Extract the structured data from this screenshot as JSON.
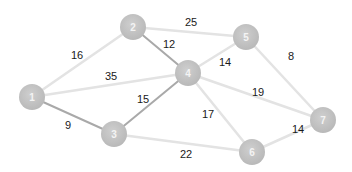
{
  "graph": {
    "type": "weighted-undirected-graph",
    "colors": {
      "background": "#ffffff",
      "node_fill": "#bdbdbd",
      "node_label": "#f4f4f4",
      "edge_default": "#e3e3e3",
      "edge_highlight": "#a9a9a9",
      "weight_text": "#1a1a1a"
    },
    "nodes": [
      {
        "id": "1",
        "label": "1",
        "x": 32,
        "y": 97
      },
      {
        "id": "2",
        "label": "2",
        "x": 133,
        "y": 27
      },
      {
        "id": "3",
        "label": "3",
        "x": 114,
        "y": 134
      },
      {
        "id": "4",
        "label": "4",
        "x": 188,
        "y": 73
      },
      {
        "id": "5",
        "label": "5",
        "x": 246,
        "y": 37
      },
      {
        "id": "6",
        "label": "6",
        "x": 252,
        "y": 152
      },
      {
        "id": "7",
        "label": "7",
        "x": 323,
        "y": 120
      }
    ],
    "edges": [
      {
        "from": "1",
        "to": "2",
        "weight": "16",
        "highlight": false,
        "lx": 77,
        "ly": 55
      },
      {
        "from": "1",
        "to": "4",
        "weight": "35",
        "highlight": false,
        "lx": 111,
        "ly": 76
      },
      {
        "from": "1",
        "to": "3",
        "weight": "9",
        "highlight": true,
        "lx": 68,
        "ly": 125
      },
      {
        "from": "2",
        "to": "4",
        "weight": "12",
        "highlight": true,
        "lx": 169,
        "ly": 44
      },
      {
        "from": "2",
        "to": "5",
        "weight": "25",
        "highlight": false,
        "lx": 191,
        "ly": 22
      },
      {
        "from": "3",
        "to": "4",
        "weight": "15",
        "highlight": true,
        "lx": 143,
        "ly": 99
      },
      {
        "from": "3",
        "to": "6",
        "weight": "22",
        "highlight": false,
        "lx": 186,
        "ly": 154
      },
      {
        "from": "4",
        "to": "5",
        "weight": "14",
        "highlight": false,
        "lx": 225,
        "ly": 62
      },
      {
        "from": "4",
        "to": "7",
        "weight": "19",
        "highlight": false,
        "lx": 258,
        "ly": 92
      },
      {
        "from": "4",
        "to": "6",
        "weight": "17",
        "highlight": false,
        "lx": 208,
        "ly": 114
      },
      {
        "from": "5",
        "to": "7",
        "weight": "8",
        "highlight": false,
        "lx": 291,
        "ly": 56
      },
      {
        "from": "6",
        "to": "7",
        "weight": "14",
        "highlight": false,
        "lx": 298,
        "ly": 129
      }
    ]
  }
}
